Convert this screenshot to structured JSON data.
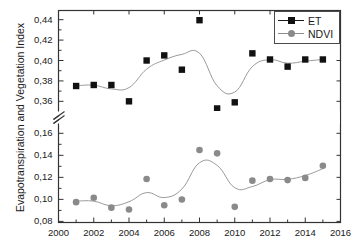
{
  "chart_data": {
    "type": "scatter",
    "title": "",
    "xlabel": "",
    "ylabel": "Evapotranspiration and Vegetation Index",
    "x": [
      2001,
      2002,
      2003,
      2004,
      2005,
      2006,
      2007,
      2008,
      2009,
      2010,
      2011,
      2012,
      2013,
      2014,
      2015
    ],
    "xlim": [
      2000,
      2016
    ],
    "xticks": [
      2000,
      2002,
      2004,
      2006,
      2008,
      2010,
      2012,
      2014,
      2016
    ],
    "xtick_labels": [
      "2000",
      "2002",
      "2004",
      "2006",
      "2008",
      "2010",
      "2012",
      "2014",
      "2016"
    ],
    "xminor_ticks": [
      2001,
      2003,
      2005,
      2007,
      2009,
      2011,
      2013,
      2015
    ],
    "broken_axis": true,
    "yticks_upper": [
      0.36,
      0.38,
      0.4,
      0.42,
      0.44
    ],
    "ytick_labels_upper": [
      "0,36",
      "0,38",
      "0,40",
      "0,42",
      "0,44"
    ],
    "ylim_upper": [
      0.351,
      0.449
    ],
    "yticks_lower": [
      0.08,
      0.1,
      0.12,
      0.14,
      0.16
    ],
    "ytick_labels_lower": [
      "0,08",
      "0,10",
      "0,12",
      "0,14",
      "0,16"
    ],
    "ylim_lower": [
      0.079,
      0.168
    ],
    "grid": false,
    "legend_position": "top-right",
    "series": [
      {
        "name": "ET",
        "marker": "square",
        "color": "#111111",
        "line_color": "#8c8c8c",
        "values": [
          0.375,
          0.376,
          0.376,
          0.36,
          0.4,
          0.405,
          0.391,
          0.4395,
          0.353,
          0.359,
          0.407,
          0.401,
          0.394,
          0.401,
          0.401
        ]
      },
      {
        "name": "NDVI",
        "marker": "circle",
        "color": "#8a8a8a",
        "line_color": "#8c8c8c",
        "values": [
          0.0975,
          0.1015,
          0.0925,
          0.0908,
          0.1185,
          0.0947,
          0.0999,
          0.1448,
          0.1418,
          0.0932,
          0.117,
          0.1185,
          0.1175,
          0.1195,
          0.1305
        ]
      }
    ]
  },
  "legend": {
    "items": [
      {
        "label": "ET"
      },
      {
        "label": "NDVI"
      }
    ]
  },
  "axis": {
    "y_title": "Evapotranspiration and Vegetation Index"
  }
}
